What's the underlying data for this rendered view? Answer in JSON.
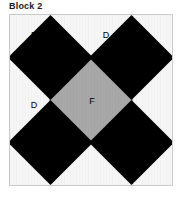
{
  "figure": {
    "title": "Block 2",
    "frame": {
      "x": 9,
      "y": 14,
      "width": 164,
      "height": 172,
      "border_color": "#c9c9c9",
      "background_color": "#f6f6f6"
    },
    "colors": {
      "dark_patch": "#000000",
      "medium_patch": "#a8a8a8",
      "background": "#f6f6f6",
      "page_background": "#ffffff",
      "text": "#000000",
      "title_text": "#1a1a1a"
    },
    "labels": [
      {
        "id": "label-e",
        "text": "E",
        "x": 24,
        "y": 20
      },
      {
        "id": "label-d-top",
        "text": "D",
        "x": 96,
        "y": 20
      },
      {
        "id": "label-d-left",
        "text": "D",
        "x": 24,
        "y": 90
      },
      {
        "id": "label-f",
        "text": "F",
        "x": 82,
        "y": 86
      }
    ],
    "patches": [
      {
        "id": "patch-e-top-left",
        "name": "E",
        "color": "#000000",
        "cx": 41,
        "cy": 43,
        "r": 43
      },
      {
        "id": "patch-d-top-right",
        "name": "D",
        "color": "#000000",
        "cx": 123,
        "cy": 43,
        "r": 43
      },
      {
        "id": "patch-d-bottom-left",
        "name": "D",
        "color": "#000000",
        "cx": 41,
        "cy": 129,
        "r": 43
      },
      {
        "id": "patch-d-bottom-right",
        "name": "D",
        "color": "#000000",
        "cx": 123,
        "cy": 129,
        "r": 43
      },
      {
        "id": "patch-f-center",
        "name": "F",
        "color": "#a8a8a8",
        "cx": 82,
        "cy": 86,
        "r": 43
      }
    ]
  }
}
